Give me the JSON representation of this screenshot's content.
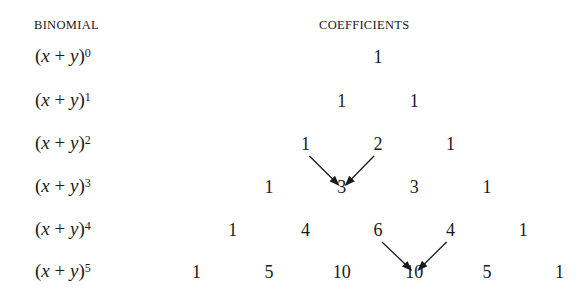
{
  "headers": {
    "binomial": "BINOMIAL",
    "coefficients": "COEFFICIENTS"
  },
  "rows": [
    {
      "base": "(x + y)",
      "exponent": "0",
      "coefficients": [
        "1"
      ]
    },
    {
      "base": "(x + y)",
      "exponent": "1",
      "coefficients": [
        "1",
        "1"
      ]
    },
    {
      "base": "(x + y)",
      "exponent": "2",
      "coefficients": [
        "1",
        "2",
        "1"
      ]
    },
    {
      "base": "(x + y)",
      "exponent": "3",
      "coefficients": [
        "1",
        "3",
        "3",
        "1"
      ]
    },
    {
      "base": "(x + y)",
      "exponent": "4",
      "coefficients": [
        "1",
        "4",
        "6",
        "4",
        "1"
      ]
    },
    {
      "base": "(x + y)",
      "exponent": "5",
      "coefficients": [
        "1",
        "5",
        "10",
        "10",
        "5",
        "1"
      ]
    }
  ],
  "arrows": [
    {
      "from": [
        2,
        0
      ],
      "to": [
        3,
        1
      ]
    },
    {
      "from": [
        2,
        1
      ],
      "to": [
        3,
        1
      ]
    },
    {
      "from": [
        4,
        2
      ],
      "to": [
        5,
        3
      ]
    },
    {
      "from": [
        4,
        3
      ],
      "to": [
        5,
        3
      ]
    }
  ]
}
